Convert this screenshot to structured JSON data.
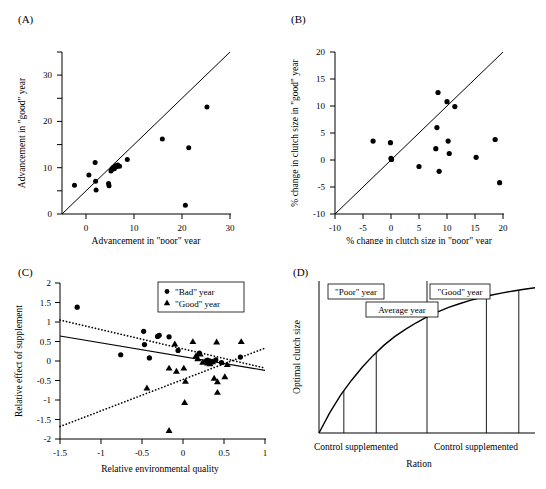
{
  "figure": {
    "background": "#ffffff",
    "marker_color": "#000000"
  },
  "chart_data": [
    {
      "id": "panel-a",
      "type": "scatter",
      "panel_label": "(A)",
      "title": "",
      "xlabel": "Advancement in \"poor\" year",
      "ylabel": "Advancement in \"good\" year",
      "xlim": [
        -5,
        30
      ],
      "ylim": [
        -5,
        30
      ],
      "xticks": [
        0,
        10,
        20,
        30
      ],
      "yticks": [
        0,
        10,
        20,
        30
      ],
      "grid": false,
      "reference_line": {
        "type": "identity",
        "from": [
          -5,
          -5
        ],
        "to": [
          30,
          30
        ],
        "style": "solid"
      },
      "series": [
        {
          "name": "species",
          "marker": "circle",
          "points": [
            [
              -2.4,
              1.2
            ],
            [
              0.6,
              3.4
            ],
            [
              1.9,
              6.1
            ],
            [
              2.0,
              2.1
            ],
            [
              2.1,
              0.2
            ],
            [
              4.7,
              1.6
            ],
            [
              4.8,
              1.1
            ],
            [
              5.2,
              4.3
            ],
            [
              5.4,
              4.6
            ],
            [
              5.6,
              5.0
            ],
            [
              5.9,
              4.8
            ],
            [
              6.1,
              5.4
            ],
            [
              6.4,
              5.2
            ],
            [
              6.6,
              5.6
            ],
            [
              7.0,
              5.3
            ],
            [
              8.6,
              6.8
            ],
            [
              15.9,
              11.2
            ],
            [
              20.7,
              -3.1
            ],
            [
              21.4,
              9.3
            ],
            [
              25.2,
              18.1
            ]
          ]
        }
      ]
    },
    {
      "id": "panel-b",
      "type": "scatter",
      "panel_label": "(B)",
      "title": "",
      "xlabel": "% change in clutch size in \"poor\" year",
      "ylabel": "% change in clutch size in \"good\" year",
      "xlim": [
        -10,
        20
      ],
      "ylim": [
        -10,
        20
      ],
      "xticks": [
        -10,
        -5,
        0,
        5,
        10,
        15,
        20
      ],
      "yticks": [
        -10,
        -5,
        0,
        5,
        10,
        15,
        20
      ],
      "grid": false,
      "reference_line": {
        "type": "identity",
        "from": [
          -10,
          -10
        ],
        "to": [
          20,
          20
        ],
        "style": "solid"
      },
      "series": [
        {
          "name": "species",
          "marker": "circle",
          "points": [
            [
              -3.2,
              3.5
            ],
            [
              -0.1,
              3.2
            ],
            [
              0.0,
              0.3
            ],
            [
              0.1,
              0.1
            ],
            [
              5.0,
              -1.2
            ],
            [
              8.0,
              2.1
            ],
            [
              8.2,
              6.0
            ],
            [
              8.4,
              12.5
            ],
            [
              8.6,
              -2.1
            ],
            [
              10.0,
              10.8
            ],
            [
              10.2,
              3.5
            ],
            [
              10.4,
              1.2
            ],
            [
              11.4,
              9.9
            ],
            [
              15.2,
              0.5
            ],
            [
              18.6,
              3.8
            ],
            [
              19.4,
              -4.2
            ]
          ]
        }
      ]
    },
    {
      "id": "panel-c",
      "type": "scatter",
      "panel_label": "(C)",
      "title": "",
      "xlabel": "Relative environmental quality",
      "ylabel": "Relative effect of supplement",
      "xlim": [
        -1.5,
        1.0
      ],
      "ylim": [
        -2.0,
        2.0
      ],
      "xticks": [
        -1.5,
        -1.0,
        -0.5,
        0.0,
        0.5,
        1.0
      ],
      "yticks": [
        2.0,
        1.5,
        1.0,
        0.5,
        0.0,
        -0.5,
        -1.0,
        -1.5,
        -2.0
      ],
      "grid": false,
      "legend": {
        "position": "top-right",
        "entries": [
          {
            "label": "\"Bad\" year",
            "marker": "circle"
          },
          {
            "label": "\"Good\" year",
            "marker": "triangle"
          }
        ]
      },
      "fit_lines": [
        {
          "name": "overall",
          "style": "solid",
          "from": [
            -1.5,
            0.64
          ],
          "to": [
            1.0,
            -0.24
          ]
        },
        {
          "name": "bad-year",
          "style": "dotted",
          "from": [
            -1.5,
            1.05
          ],
          "to": [
            1.0,
            -0.18
          ]
        },
        {
          "name": "good-year",
          "style": "dotted",
          "from": [
            -1.5,
            -1.68
          ],
          "to": [
            1.0,
            0.33
          ]
        }
      ],
      "series": [
        {
          "name": "\"Bad\" year",
          "marker": "circle",
          "points": [
            [
              -1.29,
              1.38
            ],
            [
              -0.76,
              0.16
            ],
            [
              -0.48,
              0.76
            ],
            [
              -0.47,
              0.42
            ],
            [
              -0.41,
              0.08
            ],
            [
              -0.31,
              0.63
            ],
            [
              -0.29,
              0.66
            ],
            [
              -0.17,
              0.62
            ],
            [
              -0.06,
              0.27
            ],
            [
              0.2,
              0.2
            ],
            [
              0.3,
              0.02
            ],
            [
              0.33,
              0.0
            ],
            [
              0.36,
              -0.02
            ],
            [
              0.4,
              0.03
            ],
            [
              0.47,
              -0.04
            ],
            [
              0.7,
              0.1
            ]
          ]
        },
        {
          "name": "\"Good\" year",
          "marker": "triangle",
          "points": [
            [
              -0.44,
              -0.69
            ],
            [
              -0.17,
              -0.18
            ],
            [
              -0.17,
              -1.78
            ],
            [
              -0.1,
              0.44
            ],
            [
              -0.08,
              -0.26
            ],
            [
              0.01,
              -0.18
            ],
            [
              0.03,
              -0.52
            ],
            [
              0.02,
              -1.06
            ],
            [
              0.12,
              0.5
            ],
            [
              0.16,
              0.14
            ],
            [
              0.18,
              0.06
            ],
            [
              0.21,
              0.18
            ],
            [
              0.24,
              -0.03
            ],
            [
              0.27,
              0.0
            ],
            [
              0.3,
              -0.05
            ],
            [
              0.33,
              -0.07
            ],
            [
              0.36,
              -0.02
            ],
            [
              0.38,
              -0.44
            ],
            [
              0.41,
              0.49
            ],
            [
              0.42,
              -0.53
            ],
            [
              0.42,
              -0.8
            ],
            [
              0.51,
              -0.4
            ],
            [
              0.54,
              -0.09
            ],
            [
              0.71,
              0.5
            ]
          ]
        }
      ]
    },
    {
      "id": "panel-d",
      "type": "line",
      "panel_label": "(D)",
      "title": "",
      "xlabel": "Ration",
      "ylabel": "Optimal clutch size",
      "xticks": [],
      "yticks": [],
      "grid": false,
      "curve_description": "saturating concave increasing curve",
      "curve_points": [
        [
          0.0,
          0.0
        ],
        [
          0.05,
          0.14
        ],
        [
          0.1,
          0.26
        ],
        [
          0.15,
          0.36
        ],
        [
          0.2,
          0.45
        ],
        [
          0.25,
          0.53
        ],
        [
          0.3,
          0.6
        ],
        [
          0.35,
          0.66
        ],
        [
          0.4,
          0.71
        ],
        [
          0.45,
          0.755
        ],
        [
          0.5,
          0.795
        ],
        [
          0.55,
          0.83
        ],
        [
          0.6,
          0.86
        ],
        [
          0.65,
          0.885
        ],
        [
          0.7,
          0.908
        ],
        [
          0.75,
          0.928
        ],
        [
          0.8,
          0.945
        ],
        [
          0.85,
          0.96
        ],
        [
          0.9,
          0.973
        ],
        [
          0.95,
          0.985
        ],
        [
          1.0,
          0.995
        ]
      ],
      "vertical_lines": [
        0.115,
        0.265,
        0.5,
        0.775,
        0.925
      ],
      "annotation_boxes": [
        {
          "label": "\"Poor\" year",
          "x": 0.19
        },
        {
          "label": "\"Good\" year",
          "x": 0.72
        },
        {
          "label": "Average year",
          "x": 0.5
        }
      ],
      "x_axis_groups": [
        {
          "label": "Control supplemented",
          "x": 0.19
        },
        {
          "label": "Control supplemented",
          "x": 0.85
        }
      ]
    }
  ]
}
